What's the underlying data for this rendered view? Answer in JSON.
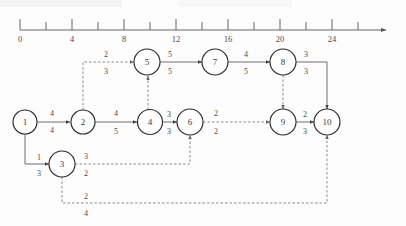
{
  "figure": {
    "kind": "network-flow-diagram",
    "axis": {
      "label": "",
      "tick_labels": [
        "0",
        "4",
        "8",
        "12",
        "16",
        "20",
        "24"
      ],
      "tick_values": [
        0,
        4,
        8,
        12,
        16,
        20,
        24
      ],
      "minor_ticks": [
        2,
        6,
        10,
        14,
        18,
        22,
        26
      ],
      "range": [
        0,
        27
      ],
      "arrow_end": true
    },
    "nodes": [
      {
        "id": "1",
        "label": "1",
        "x": 25,
        "y": 122
      },
      {
        "id": "2",
        "label": "2",
        "x": 83,
        "y": 122
      },
      {
        "id": "3",
        "label": "3",
        "x": 62,
        "y": 164
      },
      {
        "id": "4",
        "label": "4",
        "x": 150,
        "y": 122
      },
      {
        "id": "5",
        "label": "5",
        "x": 147,
        "y": 62
      },
      {
        "id": "6",
        "label": "6",
        "x": 190,
        "y": 122
      },
      {
        "id": "7",
        "label": "7",
        "x": 215,
        "y": 62
      },
      {
        "id": "8",
        "label": "8",
        "x": 283,
        "y": 62
      },
      {
        "id": "9",
        "label": "9",
        "x": 283,
        "y": 122
      },
      {
        "id": "10",
        "label": "10",
        "x": 327,
        "y": 122
      }
    ],
    "edges": [
      {
        "from": "1",
        "to": "2",
        "top": "4",
        "bottom": "4",
        "style": "solid"
      },
      {
        "from": "1",
        "to": "3",
        "top": "1",
        "bottom": "3",
        "style": "solid"
      },
      {
        "from": "2",
        "to": "4",
        "top": "4",
        "bottom": "5",
        "style": "solid"
      },
      {
        "from": "2",
        "to": "5",
        "top": "2",
        "bottom": "3",
        "style": "dashed"
      },
      {
        "from": "3",
        "to": "6",
        "top": "3",
        "bottom": "2",
        "style": "dashed"
      },
      {
        "from": "3",
        "to": "10",
        "top": "2",
        "bottom": "4",
        "style": "dashed"
      },
      {
        "from": "4",
        "to": "5",
        "top": "",
        "bottom": "",
        "style": "dashed"
      },
      {
        "from": "4",
        "to": "6",
        "top": "3",
        "bottom": "3",
        "style": "solid"
      },
      {
        "from": "5",
        "to": "7",
        "top": "5",
        "bottom": "5",
        "style": "solid"
      },
      {
        "from": "6",
        "to": "9",
        "top": "2",
        "bottom": "2",
        "style": "dashed"
      },
      {
        "from": "7",
        "to": "8",
        "top": "4",
        "bottom": "5",
        "style": "solid"
      },
      {
        "from": "8",
        "to": "9",
        "top": "",
        "bottom": "",
        "style": "dashed"
      },
      {
        "from": "8",
        "to": "10",
        "top": "3",
        "bottom": "3",
        "style": "solid"
      },
      {
        "from": "9",
        "to": "10",
        "top": "2",
        "bottom": "3",
        "style": "solid"
      }
    ],
    "edge_labels": {
      "e1_2_top": "4",
      "e1_2_bot": "4",
      "e1_3_top": "1",
      "e1_3_bot": "3",
      "e2_4_top": "4",
      "e2_4_bot": "5",
      "e2_5_top": "2",
      "e2_5_bot": "3",
      "e3_6_top": "3",
      "e3_6_bot": "2",
      "e3_10_top": "2",
      "e3_10_bot": "4",
      "e4_6_top": "3",
      "e4_6_bot": "3",
      "e5_7_top": "5",
      "e5_7_bot": "5",
      "e6_9_top": "2",
      "e6_9_bot": "2",
      "e7_8_top": "4",
      "e7_8_bot": "5",
      "e8_10_top": "3",
      "e8_10_bot": "3",
      "e9_10_top": "2",
      "e9_10_bot": "3"
    },
    "colors": {
      "stroke": "#2b2b2b",
      "edge": "#555555",
      "dashed_edge": "#777777",
      "text": "#4a4a4a",
      "background": "#fdfdfd"
    }
  }
}
